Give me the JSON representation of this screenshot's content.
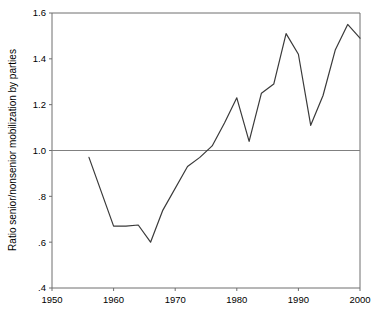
{
  "chart_data": {
    "type": "line",
    "title": "",
    "subtitle": "",
    "xlabel": "",
    "ylabel": "Ratio senior/nonsenior mobilization by parties",
    "xlim": [
      1950,
      2000
    ],
    "ylim": [
      0.4,
      1.6
    ],
    "grid": false,
    "legend": "none",
    "xticks": [
      1950,
      1960,
      1970,
      1980,
      1990,
      2000
    ],
    "xticklabels": [
      "1950",
      "1960",
      "1970",
      "1980",
      "1990",
      "2000"
    ],
    "yticks": [
      0.4,
      0.6,
      0.8,
      1.0,
      1.2,
      1.4,
      1.6
    ],
    "yticklabels": [
      ".4",
      ".6",
      ".8",
      "1.0",
      "1.2",
      "1.4",
      "1.6"
    ],
    "annotations": [
      {
        "type": "hline",
        "y": 1.0,
        "label": "parity reference line",
        "color": "#808080"
      }
    ],
    "series": [
      {
        "name": "Ratio senior/nonsenior mobilization by parties",
        "color": "#3a3a3a",
        "x": [
          1956,
          1960,
          1962,
          1964,
          1966,
          1968,
          1972,
          1974,
          1976,
          1978,
          1980,
          1982,
          1984,
          1986,
          1988,
          1990,
          1992,
          1994,
          1996,
          1998,
          2000
        ],
        "values": [
          0.97,
          0.67,
          0.67,
          0.675,
          0.6,
          0.74,
          0.93,
          0.97,
          1.02,
          1.12,
          1.23,
          1.04,
          1.25,
          1.29,
          1.51,
          1.42,
          1.11,
          1.24,
          1.44,
          1.55,
          1.49
        ]
      }
    ]
  },
  "figure": {
    "background_color": "#ffffff",
    "frame_color": "#6e6e6e",
    "line_color": "#3a3a3a",
    "reference_line_color": "#8c8c8c"
  }
}
